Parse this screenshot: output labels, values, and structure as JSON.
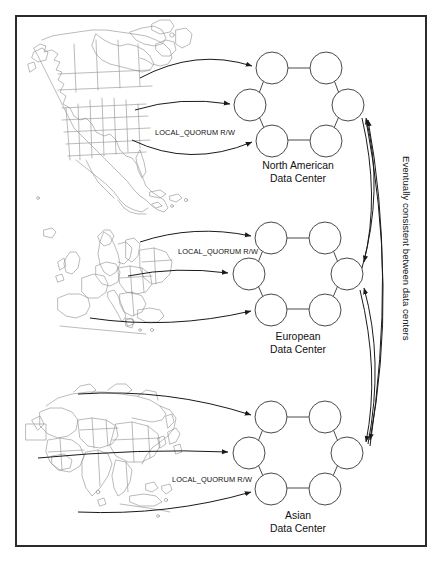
{
  "figure": {
    "type": "architecture-diagram",
    "border_color": "#2b2b2b",
    "background": "#ffffff",
    "map_outline_color": "#8d8d8d",
    "node_outline_color": "#4a4a4a",
    "arrow_color": "#1a1a1a"
  },
  "datacenters": [
    {
      "id": "north-america",
      "name_line1": "North American",
      "name_line2": "Data Center",
      "map": "north-america-map",
      "access_label": "LOCAL_QUORUM R/W",
      "node_count": 6
    },
    {
      "id": "europe",
      "name_line1": "European",
      "name_line2": "Data Center",
      "map": "europe-map",
      "access_label": "LOCAL_QUORUM R/W",
      "node_count": 6
    },
    {
      "id": "asia",
      "name_line1": "Asian",
      "name_line2": "Data Center",
      "map": "asia-map",
      "access_label": "LOCAL_QUORUM R/W",
      "node_count": 6
    }
  ],
  "replication": {
    "vertical_label": "Eventually consistent between data centers"
  }
}
